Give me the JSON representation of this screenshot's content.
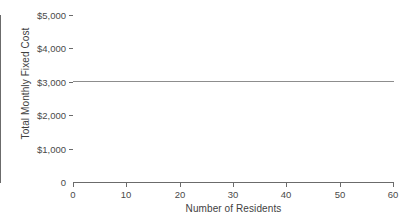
{
  "chart_data": {
    "type": "line",
    "title": "",
    "subtitle": "",
    "xlabel": "Number of Residents",
    "ylabel": "Total Monthly Fixed Cost",
    "xlim": [
      0,
      60
    ],
    "ylim": [
      0,
      5000
    ],
    "grid": false,
    "legend": "none",
    "x_ticks": [
      0,
      10,
      20,
      30,
      40,
      50,
      60
    ],
    "x_tick_labels": [
      "0",
      "10",
      "20",
      "30",
      "40",
      "50",
      "60"
    ],
    "y_ticks": [
      0,
      1000,
      2000,
      3000,
      4000,
      5000
    ],
    "y_tick_labels": [
      "0",
      "$1,000",
      "$2,000",
      "$3,000",
      "$4,000",
      "$5,000"
    ],
    "series": [
      {
        "name": "Total Monthly Fixed Cost",
        "color": "#8d8d8d",
        "x": [
          0,
          60
        ],
        "values": [
          3000,
          3000
        ]
      }
    ],
    "annotations": []
  },
  "axes": {
    "line_color": "#6b6b6b",
    "tick_label_color": "#4a4a4a",
    "title_color": "#3f3f3f",
    "background": "#ffffff"
  }
}
